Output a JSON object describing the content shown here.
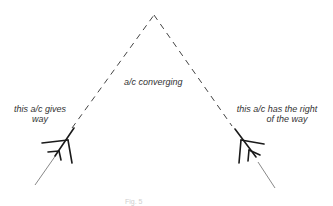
{
  "diagram": {
    "labels": {
      "center": "a/c converging",
      "left_line1": "this a/c gives",
      "left_line2": "way",
      "right_line1": "this a/c has the right",
      "right_line2": "of the way"
    },
    "caption": "Fig. 5",
    "colors": {
      "line": "#333333",
      "aircraft": "#1a1a1a",
      "background": "#ffffff"
    },
    "elements": [
      {
        "type": "dashed-path",
        "from": "left aircraft",
        "to": "apex",
        "apex": [
          154,
          14
        ]
      },
      {
        "type": "dashed-path",
        "from": "right aircraft",
        "to": "apex"
      },
      {
        "type": "aircraft-symbol",
        "side": "left",
        "heading": "north-east"
      },
      {
        "type": "aircraft-symbol",
        "side": "right",
        "heading": "north-west"
      }
    ]
  }
}
